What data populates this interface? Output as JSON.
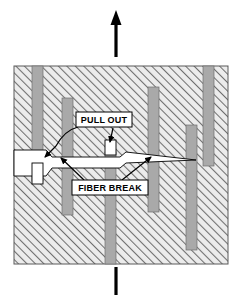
{
  "figure": {
    "background_color": "#ffffff",
    "matrix": {
      "name": "matrix-block",
      "fill_color": "#e8e8e8",
      "hatch_color": "#707070",
      "outline_color": "#555555",
      "x": 14,
      "y": 66,
      "width": 214,
      "height": 198
    },
    "fiber_color": "#a9a9a9",
    "fiber_edge_color": "#6e6e6e",
    "crack_fill": "#ffffff",
    "crack_edge": "#000000",
    "arrow_color": "#000000"
  },
  "labels": {
    "pull_out": {
      "text": "PULL OUT",
      "x": 104,
      "y": 120,
      "box_x": 76,
      "box_y": 112,
      "box_w": 56,
      "box_h": 15
    },
    "fiber_break": {
      "text": "FIBER BREAK",
      "x": 110,
      "y": 188,
      "box_x": 72,
      "box_y": 180,
      "box_w": 76,
      "box_h": 15
    }
  },
  "load_arrows": {
    "top": {
      "name": "tensile-load-arrow-up",
      "x": 116,
      "y_tail": 57,
      "y_head": 12,
      "head_width": 11,
      "head_length": 14,
      "shaft_width": 3
    },
    "bottom": {
      "name": "tensile-load-arrow-down",
      "x": 116,
      "y_tail": 266,
      "y_head": 295,
      "shaft_width": 3
    }
  },
  "fibers": [
    {
      "name": "fiber-1",
      "x": 32,
      "y": 66,
      "w": 11,
      "h": 115
    },
    {
      "name": "fiber-2",
      "x": 62,
      "y": 98,
      "w": 11,
      "h": 117
    },
    {
      "name": "fiber-3",
      "x": 105,
      "y": 152,
      "w": 11,
      "h": 112
    },
    {
      "name": "fiber-4",
      "x": 148,
      "y": 87,
      "w": 11,
      "h": 125
    },
    {
      "name": "fiber-5",
      "x": 186,
      "y": 125,
      "w": 11,
      "h": 125
    },
    {
      "name": "fiber-6",
      "x": 203,
      "y": 66,
      "w": 11,
      "h": 100
    }
  ],
  "pulled_out_fibers": [
    {
      "name": "pulled-fiber-left",
      "x": 32,
      "y": 163,
      "w": 11,
      "h": 21
    },
    {
      "name": "pulled-fiber-center",
      "x": 105,
      "y": 140,
      "w": 11,
      "h": 15
    }
  ],
  "crack": {
    "name": "crack-opening",
    "description": "Wedge shaped white crack / debonded region crossing the matrix",
    "path": "M 14,150 L 46,150 L 52,157 L 120,157 L 126,152 L 196,160 L 126,163 L 120,168 L 52,168 L 46,176 L 14,176 Z"
  },
  "leader_lines": [
    {
      "name": "leader-pullout-to-center-fiber",
      "from_x": 113,
      "from_y": 128,
      "to_x": 110,
      "to_y": 143
    },
    {
      "name": "leader-pullout-to-left-crack",
      "from_x": 80,
      "from_y": 128,
      "to_x": 44,
      "to_y": 158
    },
    {
      "name": "leader-break-to-left-fiber",
      "from_x": 84,
      "from_y": 180,
      "to_x": 60,
      "to_y": 160
    },
    {
      "name": "leader-break-to-right-fiber",
      "from_x": 122,
      "from_y": 180,
      "to_x": 152,
      "to_y": 160
    }
  ]
}
